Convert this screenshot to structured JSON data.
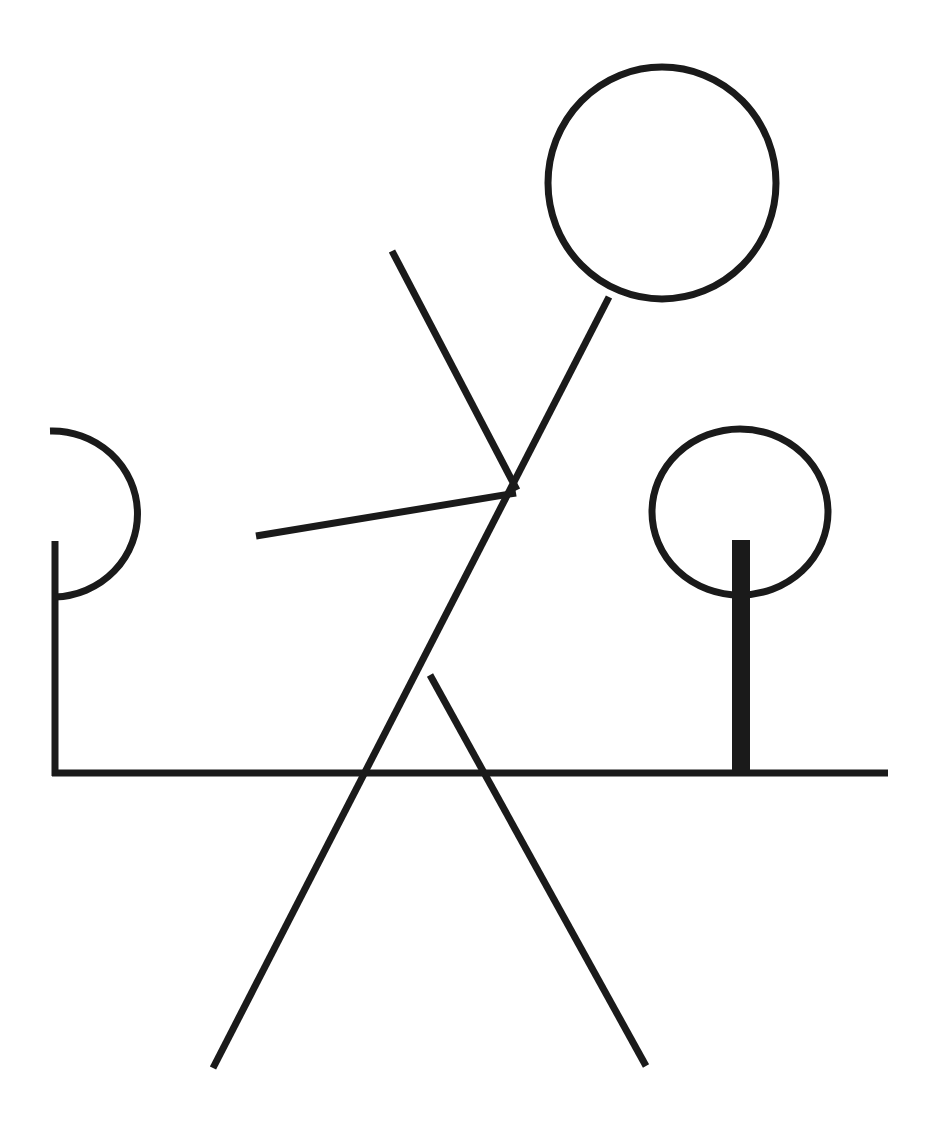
{
  "diagram": {
    "stroke_color": "#1a1a1a",
    "background": "#ffffff",
    "stroke_width": 7,
    "elements": {
      "head": {
        "cx": 662,
        "cy": 183,
        "rx": 114,
        "ry": 116
      },
      "body": {
        "x1": 609,
        "y1": 297,
        "x2": 213,
        "y2": 1068
      },
      "upper_arm": {
        "x1": 392,
        "y1": 251,
        "x2": 517,
        "y2": 490
      },
      "lower_arm": {
        "x1": 256,
        "y1": 536,
        "x2": 516,
        "y2": 493
      },
      "leg": {
        "x1": 430,
        "y1": 675,
        "x2": 646,
        "y2": 1066
      },
      "ground": {
        "x1": 52,
        "y1": 773,
        "x2": 888,
        "y2": 773
      },
      "left_post": {
        "x1": 55,
        "y1": 541,
        "x2": 55,
        "y2": 776
      },
      "left_arc": {
        "d": "M 50 431 A 85 83 0 0 1 55 597"
      },
      "right_circle": {
        "cx": 740,
        "cy": 512,
        "rx": 88,
        "ry": 83
      },
      "right_post": {
        "x": 732,
        "y": 540,
        "width": 18,
        "height": 236
      }
    }
  }
}
